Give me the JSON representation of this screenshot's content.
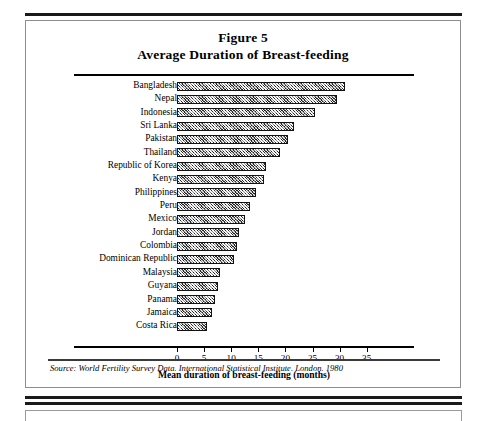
{
  "figure": {
    "title_line1": "Figure 5",
    "title_line2": "Average Duration of Breast-feeding",
    "source": "Source: World Fertility Survey Data. International Statistical Institute. London. 1980"
  },
  "chart_data": {
    "type": "bar",
    "orientation": "horizontal",
    "xlabel": "Mean duration of breast-feeding (months)",
    "ylabel": "",
    "xlim": [
      0,
      37
    ],
    "xticks": [
      0,
      5,
      10,
      15,
      20,
      25,
      30,
      35
    ],
    "grid": false,
    "legend": false,
    "bar_fill": "#8a8a8a",
    "bar_pattern": "cross-hatch",
    "bar_border": "#111111",
    "categories": [
      "Bangladesh",
      "Nepal",
      "Indonesia",
      "Sri Lanka",
      "Pakistan",
      "Thailand",
      "Republic of Korea",
      "Kenya",
      "Philippines",
      "Peru",
      "Mexico",
      "Jordan",
      "Colombia",
      "Dominican Republic",
      "Malaysia",
      "Guyana",
      "Panama",
      "Jamaica",
      "Costa Rica"
    ],
    "values": [
      31.0,
      29.5,
      25.5,
      21.5,
      20.5,
      19.0,
      16.5,
      16.0,
      14.5,
      13.5,
      12.5,
      11.5,
      11.0,
      10.5,
      8.0,
      7.5,
      7.0,
      6.5,
      5.5
    ],
    "units": "months"
  },
  "axis": {
    "tick_labels": [
      "0",
      "5",
      "10",
      "15",
      "20",
      "25",
      "30",
      "35"
    ]
  }
}
